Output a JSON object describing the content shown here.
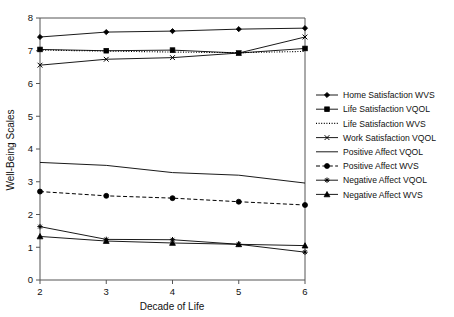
{
  "chart_data": {
    "type": "line",
    "title": "",
    "xlabel": "Decade of Life",
    "ylabel": "Well-Being Scales",
    "x": [
      2,
      3,
      4,
      5,
      6
    ],
    "xticklabels": [
      "2",
      "3",
      "4",
      "5",
      "6"
    ],
    "yticklabels": [
      "0",
      "1",
      "2",
      "3",
      "4",
      "5",
      "6",
      "7",
      "8"
    ],
    "xlim": [
      2,
      6
    ],
    "ylim": [
      0,
      8
    ],
    "grid": false,
    "legend_position": "right",
    "series": [
      {
        "name": "Home Satisfaction WVS",
        "marker": "diamond",
        "linestyle": "solid",
        "values": [
          7.42,
          7.57,
          7.6,
          7.66,
          7.69
        ]
      },
      {
        "name": "Life Satisfaction VQOL",
        "marker": "square",
        "linestyle": "solid",
        "values": [
          7.04,
          7.0,
          7.02,
          6.93,
          7.07
        ]
      },
      {
        "name": "Life Satisfaction WVS",
        "marker": "none",
        "linestyle": "dotted",
        "values": [
          7.02,
          6.99,
          6.96,
          6.94,
          6.98
        ]
      },
      {
        "name": "Work Satisfaction VQOL",
        "marker": "x",
        "linestyle": "solid",
        "values": [
          6.56,
          6.74,
          6.79,
          6.93,
          7.42
        ]
      },
      {
        "name": "Positive Affect VQOL",
        "marker": "none",
        "linestyle": "solid",
        "values": [
          3.59,
          3.5,
          3.28,
          3.2,
          2.96
        ]
      },
      {
        "name": "Positive Affect WVS",
        "marker": "circle",
        "linestyle": "dashed",
        "values": [
          2.7,
          2.57,
          2.5,
          2.39,
          2.29
        ]
      },
      {
        "name": "Negative Affect VQOL",
        "marker": "star",
        "linestyle": "solid",
        "values": [
          1.63,
          1.24,
          1.23,
          1.09,
          0.85
        ]
      },
      {
        "name": "Negative Affect WVS",
        "marker": "triangle",
        "linestyle": "solid",
        "values": [
          1.33,
          1.19,
          1.13,
          1.09,
          1.05
        ]
      }
    ]
  },
  "legend": {
    "entries": [
      "Home Satisfaction WVS",
      "Life Satisfaction VQOL",
      "Life Satisfaction WVS",
      "Work Satisfaction VQOL",
      "Positive Affect VQOL",
      "Positive Affect WVS",
      "Negative Affect VQOL",
      "Negative Affect WVS"
    ]
  },
  "axes": {
    "x_title": "Decade of Life",
    "y_title": "Well-Being Scales"
  }
}
